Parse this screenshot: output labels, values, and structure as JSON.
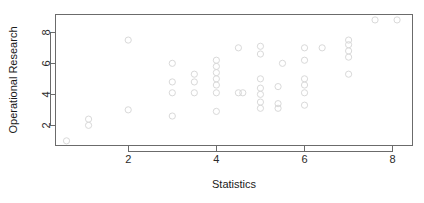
{
  "chart_data": {
    "type": "scatter",
    "title": "",
    "xlabel": "Statistics",
    "ylabel": "Operational Research",
    "xlim": [
      0.35,
      8.45
    ],
    "ylim": [
      0.7,
      9.15
    ],
    "xticks": [
      2,
      4,
      6,
      8
    ],
    "yticks": [
      2,
      4,
      6,
      8
    ],
    "xtick_labels": [
      "2",
      "4",
      "6",
      "8"
    ],
    "ytick_labels": [
      "2",
      "4",
      "6",
      "8"
    ],
    "grid": false,
    "legend": null,
    "marker": "open-circle",
    "marker_color": "#d9d9d9",
    "points": [
      [
        0.6,
        1.0
      ],
      [
        1.1,
        2.0
      ],
      [
        1.1,
        2.4
      ],
      [
        2.0,
        3.0
      ],
      [
        2.0,
        7.5
      ],
      [
        3.0,
        2.6
      ],
      [
        3.0,
        4.1
      ],
      [
        3.0,
        4.8
      ],
      [
        3.0,
        6.0
      ],
      [
        3.5,
        4.1
      ],
      [
        3.5,
        4.8
      ],
      [
        3.5,
        5.3
      ],
      [
        4.0,
        2.9
      ],
      [
        4.0,
        4.1
      ],
      [
        4.0,
        4.6
      ],
      [
        4.0,
        5.0
      ],
      [
        4.0,
        5.4
      ],
      [
        4.0,
        5.8
      ],
      [
        4.0,
        6.2
      ],
      [
        4.5,
        4.1
      ],
      [
        4.5,
        7.0
      ],
      [
        4.6,
        4.1
      ],
      [
        5.0,
        3.1
      ],
      [
        5.0,
        3.5
      ],
      [
        5.0,
        4.0
      ],
      [
        5.0,
        4.4
      ],
      [
        5.0,
        5.0
      ],
      [
        5.0,
        6.6
      ],
      [
        5.0,
        7.1
      ],
      [
        5.4,
        3.1
      ],
      [
        5.4,
        3.4
      ],
      [
        5.4,
        4.5
      ],
      [
        5.5,
        6.0
      ],
      [
        6.0,
        3.3
      ],
      [
        6.0,
        4.1
      ],
      [
        6.0,
        4.6
      ],
      [
        6.0,
        5.0
      ],
      [
        6.0,
        6.2
      ],
      [
        6.0,
        7.0
      ],
      [
        6.4,
        7.0
      ],
      [
        7.0,
        5.3
      ],
      [
        7.0,
        6.4
      ],
      [
        7.0,
        6.8
      ],
      [
        7.0,
        7.2
      ],
      [
        7.0,
        7.5
      ],
      [
        7.6,
        8.8
      ],
      [
        8.1,
        8.8
      ]
    ]
  }
}
